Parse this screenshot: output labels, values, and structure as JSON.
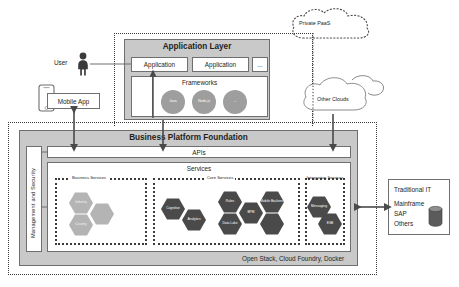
{
  "diagram": {
    "colors": {
      "panel_gray": "#c9c9c9",
      "hex_dark": "#4a4a4a",
      "hex_light": "#b4b4b4",
      "circle_gray": "#9e9e9e",
      "stroke": "#6f6f6f",
      "text": "#231f20"
    }
  },
  "private_paas": {
    "label": "Private PaaS"
  },
  "other_clouds": {
    "label": "Other Clouds"
  },
  "actors": {
    "user": {
      "label": "User",
      "icon": "person-icon"
    },
    "mobile_app": {
      "label": "Mobile App",
      "icon": "smartphone-icon"
    }
  },
  "application_layer": {
    "title": "Application Layer",
    "apps": [
      {
        "label": "Application"
      },
      {
        "label": "Application"
      },
      {
        "label": "..."
      }
    ],
    "frameworks": {
      "title": "Frameworks",
      "items": [
        {
          "label": "Java"
        },
        {
          "label": "Node.js"
        },
        {
          "label": "..."
        }
      ]
    }
  },
  "platform": {
    "title": "Business Platform Foundation",
    "management_security": {
      "label": "Management and Security"
    },
    "apis": {
      "label": "APIs"
    },
    "services": {
      "title": "Services",
      "groups": [
        {
          "name": "business_services",
          "title": "Business Services",
          "hexagons": [
            {
              "label": "Industry",
              "tone": "light"
            },
            {
              "label": "",
              "tone": "light"
            },
            {
              "label": "Country",
              "tone": "light"
            }
          ]
        },
        {
          "name": "core_services",
          "title": "Core Services",
          "hexagons": [
            {
              "label": "Cognitive",
              "tone": "dark"
            },
            {
              "label": "Analytics",
              "tone": "dark"
            },
            {
              "label": "Rules",
              "tone": "dark"
            },
            {
              "label": "BPM",
              "tone": "dark"
            },
            {
              "label": "Mobile Backend",
              "tone": "dark"
            },
            {
              "label": "Data Lake",
              "tone": "dark"
            },
            {
              "label": "",
              "tone": "dark"
            }
          ]
        },
        {
          "name": "integration_services",
          "title": "Integration Services",
          "hexagons": [
            {
              "label": "Messaging",
              "tone": "dark"
            },
            {
              "label": "ESB",
              "tone": "dark"
            }
          ]
        }
      ]
    },
    "infrastructure": {
      "label": "Open Stack, Cloud Foundry, Docker"
    }
  },
  "traditional_it": {
    "title": "Traditional IT",
    "items": [
      "Mainframe",
      "SAP",
      "Others"
    ],
    "icon": "database-cylinder-icon"
  }
}
